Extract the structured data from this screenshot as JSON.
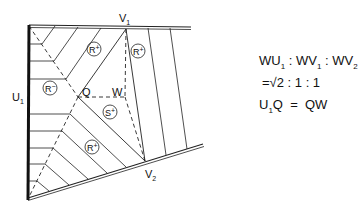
{
  "diagram": {
    "points": {
      "U1": {
        "label": "U",
        "sub": "1",
        "x": 29,
        "y": 97
      },
      "V1": {
        "label": "V",
        "sub": "1",
        "x": 126,
        "y": 29
      },
      "V2": {
        "label": "V",
        "sub": "2",
        "x": 145,
        "y": 161
      },
      "Q": {
        "label": "Q",
        "x": 78,
        "y": 97
      },
      "W": {
        "label": "W",
        "x": 125,
        "y": 97
      }
    },
    "regions": [
      {
        "label": "R",
        "sup": "+",
        "x": 94,
        "y": 48
      },
      {
        "label": "R",
        "sup": "+",
        "x": 138,
        "y": 50
      },
      {
        "label": "R",
        "sup": "−",
        "x": 50,
        "y": 88
      },
      {
        "label": "S",
        "sup": "+",
        "x": 110,
        "y": 112
      },
      {
        "label": "R",
        "sup": "+",
        "x": 92,
        "y": 148
      }
    ]
  },
  "equations": {
    "line1": {
      "a": "WU",
      "a_sub": "1",
      "sep1": " : ",
      "b": "WV",
      "b_sub": "1",
      "sep2": " : ",
      "c": "WV",
      "c_sub": "2"
    },
    "line2": "=√2 : 1 : 1",
    "line3": {
      "a": "U",
      "a_sub": "1",
      "b": "Q  =  QW"
    }
  },
  "colors": {
    "line": "#111111",
    "background": "#ffffff"
  }
}
